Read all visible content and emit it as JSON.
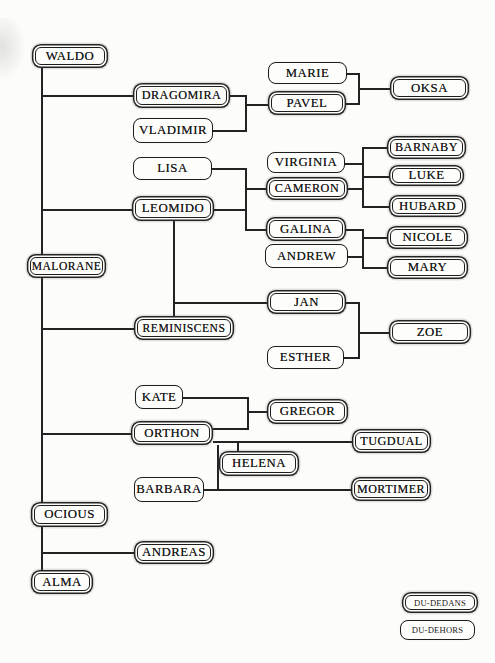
{
  "page": {
    "background": "#fcfcfa",
    "ink": "#232323",
    "box_fill": "#fdfdfb",
    "text_color": "#1a1a1a"
  },
  "legend": {
    "double_style_label": "DU-DEDANS",
    "single_style_label": "DU-DEHORS"
  },
  "tree": {
    "nodes": [
      {
        "id": "waldo",
        "label": "WALDO",
        "style": "double",
        "x": 32,
        "y": 44,
        "w": 76,
        "h": 24
      },
      {
        "id": "dragomira",
        "label": "DRAGOMIRA",
        "style": "double",
        "x": 133,
        "y": 83,
        "w": 97,
        "h": 25,
        "fs": 12.2
      },
      {
        "id": "vladimir",
        "label": "VLADIMIR",
        "style": "single",
        "x": 133,
        "y": 118,
        "w": 80,
        "h": 25
      },
      {
        "id": "marie",
        "label": "MARIE",
        "style": "single",
        "x": 268,
        "y": 62,
        "w": 79,
        "h": 22
      },
      {
        "id": "pavel",
        "label": "PAVEL",
        "style": "double",
        "x": 268,
        "y": 91,
        "w": 78,
        "h": 24
      },
      {
        "id": "oksa",
        "label": "OKSA",
        "style": "double",
        "x": 390,
        "y": 76,
        "w": 79,
        "h": 24
      },
      {
        "id": "lisa",
        "label": "LISA",
        "style": "single",
        "x": 133,
        "y": 157,
        "w": 79,
        "h": 23
      },
      {
        "id": "leomido",
        "label": "LEOMIDO",
        "style": "double",
        "x": 132,
        "y": 196,
        "w": 82,
        "h": 25
      },
      {
        "id": "virginia",
        "label": "VIRGINIA",
        "style": "single",
        "x": 267,
        "y": 152,
        "w": 78,
        "h": 21
      },
      {
        "id": "cameron",
        "label": "CAMERON",
        "style": "double",
        "x": 266,
        "y": 177,
        "w": 82,
        "h": 23,
        "fs": 12.2
      },
      {
        "id": "barnaby",
        "label": "BARNABY",
        "style": "double",
        "x": 387,
        "y": 136,
        "w": 79,
        "h": 23,
        "fs": 12.2
      },
      {
        "id": "luke",
        "label": "LUKE",
        "style": "double",
        "x": 389,
        "y": 165,
        "w": 75,
        "h": 21
      },
      {
        "id": "hubard",
        "label": "HUBARD",
        "style": "double",
        "x": 389,
        "y": 195,
        "w": 77,
        "h": 22
      },
      {
        "id": "galina",
        "label": "GALINA",
        "style": "double",
        "x": 266,
        "y": 217,
        "w": 80,
        "h": 24
      },
      {
        "id": "andrew",
        "label": "ANDREW",
        "style": "single",
        "x": 265,
        "y": 244,
        "w": 83,
        "h": 24
      },
      {
        "id": "nicole",
        "label": "NICOLE",
        "style": "double",
        "x": 387,
        "y": 226,
        "w": 81,
        "h": 23
      },
      {
        "id": "mary",
        "label": "MARY",
        "style": "double",
        "x": 387,
        "y": 256,
        "w": 81,
        "h": 23
      },
      {
        "id": "malorane",
        "label": "MALORANE",
        "style": "double",
        "x": 27,
        "y": 254,
        "w": 79,
        "h": 24,
        "fs": 11.6
      },
      {
        "id": "reminiscens",
        "label": "REMINISCENS",
        "style": "double",
        "x": 134,
        "y": 316,
        "w": 100,
        "h": 24,
        "fs": 11.6
      },
      {
        "id": "jan",
        "label": "JAN",
        "style": "double",
        "x": 267,
        "y": 290,
        "w": 79,
        "h": 24
      },
      {
        "id": "esther",
        "label": "ESTHER",
        "style": "single",
        "x": 267,
        "y": 346,
        "w": 77,
        "h": 23
      },
      {
        "id": "zoe",
        "label": "ZOE",
        "style": "double",
        "x": 389,
        "y": 320,
        "w": 82,
        "h": 24
      },
      {
        "id": "kate",
        "label": "KATE",
        "style": "single",
        "x": 135,
        "y": 385,
        "w": 48,
        "h": 24
      },
      {
        "id": "orthon",
        "label": "ORTHON",
        "style": "double",
        "x": 131,
        "y": 421,
        "w": 82,
        "h": 24
      },
      {
        "id": "gregor",
        "label": "GREGOR",
        "style": "double",
        "x": 267,
        "y": 399,
        "w": 81,
        "h": 25
      },
      {
        "id": "helena",
        "label": "HELENA",
        "style": "double",
        "x": 219,
        "y": 451,
        "w": 80,
        "h": 25
      },
      {
        "id": "barbara",
        "label": "BARBARA",
        "style": "single",
        "x": 134,
        "y": 477,
        "w": 70,
        "h": 25
      },
      {
        "id": "tugdual",
        "label": "TUGDUAL",
        "style": "double",
        "x": 352,
        "y": 429,
        "w": 79,
        "h": 24,
        "fs": 12.2
      },
      {
        "id": "mortimer",
        "label": "MORTIMER",
        "style": "double",
        "x": 351,
        "y": 477,
        "w": 80,
        "h": 24,
        "fs": 12
      },
      {
        "id": "ocious",
        "label": "OCIOUS",
        "style": "double",
        "x": 31,
        "y": 502,
        "w": 77,
        "h": 25
      },
      {
        "id": "andreas",
        "label": "ANDREAS",
        "style": "double",
        "x": 134,
        "y": 541,
        "w": 80,
        "h": 23
      },
      {
        "id": "alma",
        "label": "ALMA",
        "style": "double",
        "x": 31,
        "y": 570,
        "w": 62,
        "h": 24
      },
      {
        "id": "legend-du-dedans",
        "label": "DU-DEDANS",
        "style": "double",
        "x": 402,
        "y": 592,
        "w": 76,
        "h": 21,
        "small": true
      },
      {
        "id": "legend-du-dehors",
        "label": "DU-DEHORS",
        "style": "single",
        "x": 400,
        "y": 620,
        "w": 75,
        "h": 20,
        "small": true
      }
    ],
    "edges": [
      [
        41,
        68,
        41,
        571
      ],
      [
        41,
        95,
        133,
        95
      ],
      [
        41,
        209,
        132,
        209
      ],
      [
        41,
        328,
        134,
        328
      ],
      [
        41,
        433,
        131,
        433
      ],
      [
        41,
        552,
        134,
        552
      ],
      [
        230,
        95,
        245,
        95
      ],
      [
        245,
        95,
        245,
        130
      ],
      [
        213,
        130,
        245,
        130
      ],
      [
        245,
        104,
        268,
        104
      ],
      [
        347,
        73,
        358,
        73
      ],
      [
        358,
        73,
        358,
        103
      ],
      [
        346,
        103,
        358,
        103
      ],
      [
        358,
        88,
        390,
        88
      ],
      [
        212,
        168,
        245,
        168
      ],
      [
        245,
        168,
        245,
        229
      ],
      [
        214,
        209,
        245,
        209
      ],
      [
        245,
        188,
        266,
        188
      ],
      [
        245,
        229,
        266,
        229
      ],
      [
        345,
        163,
        362,
        163
      ],
      [
        348,
        188,
        362,
        188
      ],
      [
        362,
        147,
        362,
        206
      ],
      [
        362,
        147,
        387,
        147
      ],
      [
        362,
        176,
        389,
        176
      ],
      [
        362,
        206,
        389,
        206
      ],
      [
        346,
        229,
        362,
        229
      ],
      [
        348,
        256,
        362,
        256
      ],
      [
        362,
        229,
        362,
        267
      ],
      [
        362,
        237,
        387,
        237
      ],
      [
        362,
        267,
        387,
        267
      ],
      [
        173,
        221,
        173,
        316
      ],
      [
        173,
        302,
        267,
        302
      ],
      [
        346,
        302,
        358,
        302
      ],
      [
        358,
        302,
        358,
        357
      ],
      [
        344,
        357,
        358,
        357
      ],
      [
        358,
        332,
        389,
        332
      ],
      [
        183,
        397,
        247,
        397
      ],
      [
        247,
        397,
        247,
        428
      ],
      [
        213,
        428,
        247,
        428
      ],
      [
        247,
        411,
        267,
        411
      ],
      [
        213,
        441,
        352,
        441
      ],
      [
        237,
        441,
        237,
        452
      ],
      [
        217,
        445,
        217,
        489
      ],
      [
        204,
        489,
        351,
        489
      ]
    ]
  }
}
